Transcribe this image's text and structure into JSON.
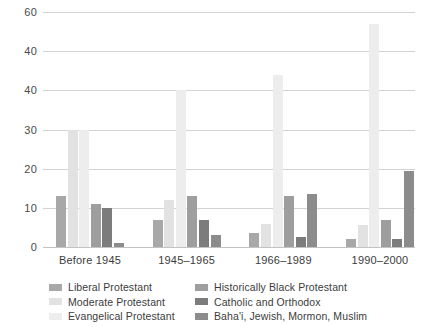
{
  "title_fragment": "",
  "chart_data": {
    "type": "bar",
    "title": "",
    "subtitle": "",
    "xlabel": "",
    "ylabel": "",
    "ylim": [
      0,
      60
    ],
    "grid": true,
    "legend_position": "bottom",
    "y_ticks": [
      {
        "label": "60",
        "value": 60
      },
      {
        "label": "40",
        "value": 50
      },
      {
        "label": "40",
        "value": 40
      },
      {
        "label": "30",
        "value": 30
      },
      {
        "label": "20",
        "value": 20
      },
      {
        "label": "10",
        "value": 10
      },
      {
        "label": "0",
        "value": 0
      }
    ],
    "categories": [
      "Before 1945",
      "1945–1965",
      "1966–1989",
      "1990–2000"
    ],
    "series": [
      {
        "name": "Liberal Protestant",
        "color": "#a8a8a8",
        "values": [
          13,
          7,
          3.5,
          2
        ]
      },
      {
        "name": "Moderate Protestant",
        "color": "#e2e2e2",
        "values": [
          30,
          12,
          6,
          5.5
        ]
      },
      {
        "name": "Evangelical Protestant",
        "color": "#ededed",
        "values": [
          30,
          40,
          44,
          57
        ]
      },
      {
        "name": "Historically Black Protestant",
        "color": "#9e9e9e",
        "values": [
          11,
          13,
          13,
          7
        ]
      },
      {
        "name": "Catholic and Orthodox",
        "color": "#7c7c7c",
        "values": [
          10,
          7,
          2.5,
          2
        ]
      },
      {
        "name": "Baha'i, Jewish, Mormon, Muslim",
        "color": "#8c8c8c",
        "values": [
          1,
          3,
          13.5,
          19.5
        ]
      }
    ]
  }
}
